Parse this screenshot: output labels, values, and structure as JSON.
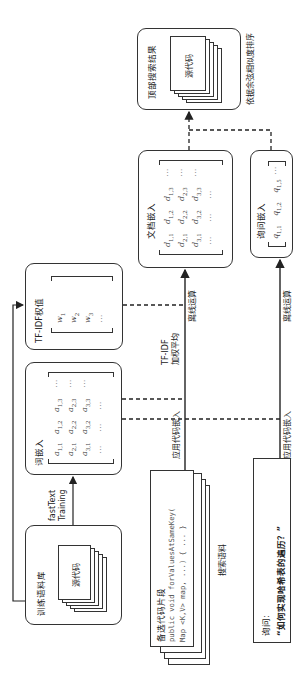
{
  "diagram": {
    "orientation": "rotated -90deg (text reads bottom-to-top)",
    "nodes": {
      "training_corpus": {
        "title": "训练语料库",
        "doc_label": "源代码"
      },
      "word_embedding": {
        "title": "词嵌入",
        "matrix": [
          [
            "a_{1,1}",
            "a_{1,2}",
            "a_{1,3}",
            "⋯"
          ],
          [
            "a_{2,1}",
            "a_{2,2}",
            "a_{2,3}",
            "⋯"
          ],
          [
            "a_{3,1}",
            "a_{3,2}",
            "a_{3,3}",
            "⋯"
          ],
          [
            "⋯",
            "⋯",
            "⋯",
            ""
          ]
        ]
      },
      "tfidf_weights": {
        "title": "TF-IDF权值",
        "vector": [
          "w_1",
          "w_2",
          "w_3",
          "⋯"
        ]
      },
      "candidate_snippets": {
        "title": "备选代码片段",
        "code_line1": "public void forValuesAtSameKey(",
        "code_line2": "    Map <K,V> map, ...) { ... }",
        "caption": "搜索语料"
      },
      "document_embedding": {
        "title": "文档嵌入",
        "matrix": [
          [
            "d_{1,1}",
            "d_{1,2}",
            "d_{1,3}",
            "⋯"
          ],
          [
            "d_{2,1}",
            "d_{2,2}",
            "d_{2,3}",
            "⋯"
          ],
          [
            "d_{3,1}",
            "d_{3,2}",
            "d_{3,3}",
            "⋯"
          ],
          [
            "⋯",
            "⋯",
            "⋯",
            ""
          ]
        ]
      },
      "query_embedding": {
        "title": "询问嵌入",
        "vector": [
          "q_{1,1}",
          "q_{1,2}",
          "q_{1,5}",
          "⋯"
        ]
      },
      "query": {
        "label": "询问:",
        "text": "“如何实现哈希表的遍历？”"
      },
      "top_results": {
        "title": "顶部搜索结果",
        "doc_label": "源代码",
        "caption": "依据余弦相似度排序"
      }
    },
    "edges": {
      "fasttext_line1": "fastText",
      "fasttext_line2": "Training",
      "tfidf_avg_line1": "TF-IDF",
      "tfidf_avg_line2": "加权平均",
      "apply_code_embedding_top": "应用代码嵌入",
      "offline_compute_top": "离线运算",
      "apply_code_embedding_bottom": "应用代码嵌入",
      "offline_compute_bottom": "离线运算"
    }
  }
}
